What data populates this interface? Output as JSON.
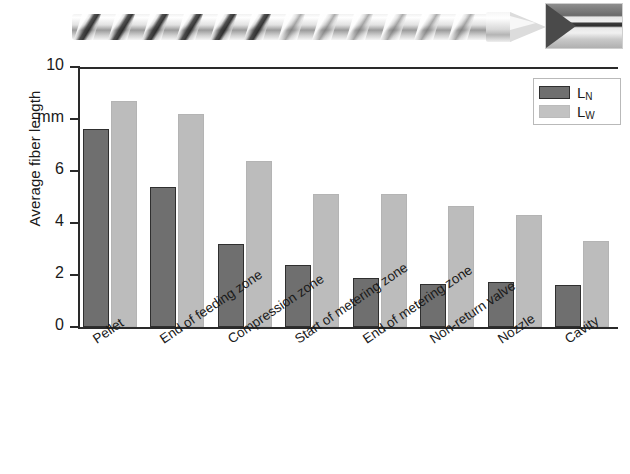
{
  "figure": {
    "screw_photo_caption": "injection-molding-screw-photograph",
    "inset_photo_caption": "nozzle-detail-photograph"
  },
  "chart_data": {
    "type": "bar",
    "title": "",
    "xlabel": "",
    "ylabel": "Average fiber length",
    "yunit": "mm",
    "ylim": [
      0,
      10
    ],
    "yticks": [
      0,
      2,
      4,
      6,
      8,
      10
    ],
    "ytick_labels": [
      "0",
      "2",
      "4",
      "6",
      "mm",
      "10"
    ],
    "grid": false,
    "legend_position": "upper right",
    "categories": [
      "Pellet",
      "End of feeding zone",
      "Compression zone",
      "Start of metering zone",
      "End of metering zone",
      "Non-return valve",
      "Nozzle",
      "Cavity"
    ],
    "series": [
      {
        "name": "LN",
        "label": "L",
        "subscript": "N",
        "color": "#6f6f6f",
        "values": [
          7.6,
          5.4,
          3.2,
          2.4,
          1.9,
          1.65,
          1.75,
          1.6
        ]
      },
      {
        "name": "LW",
        "label": "L",
        "subscript": "W",
        "color": "#bcbcbc",
        "values": [
          8.7,
          8.2,
          6.4,
          5.1,
          5.1,
          4.65,
          4.3,
          3.3
        ]
      }
    ]
  }
}
